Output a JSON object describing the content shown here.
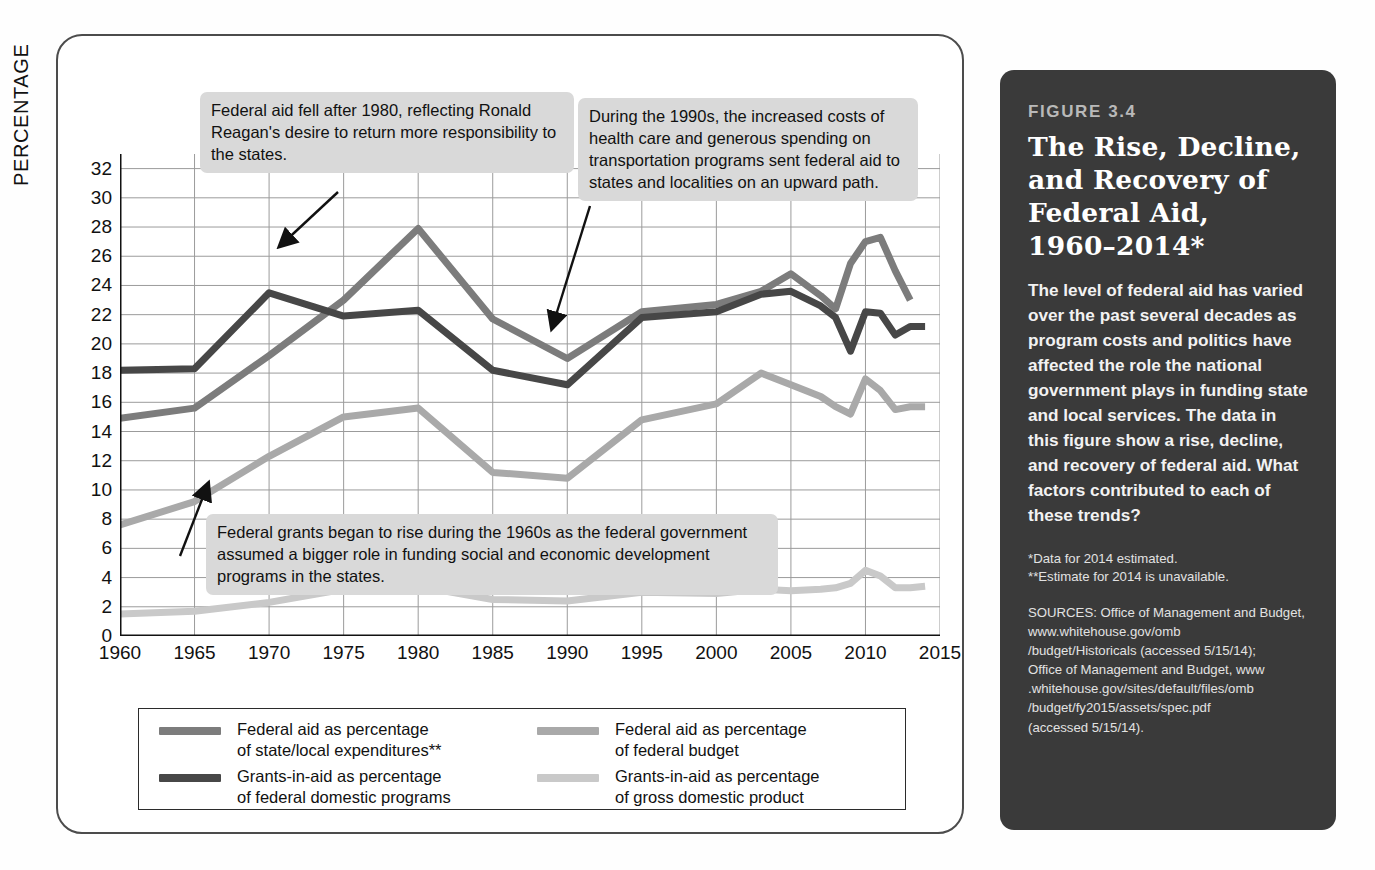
{
  "axis": {
    "ylabel": "PERCENTAGE",
    "yticks": [
      0,
      2,
      4,
      6,
      8,
      10,
      12,
      14,
      16,
      18,
      20,
      22,
      24,
      26,
      28,
      30,
      32
    ],
    "xticks": [
      "1960",
      "1965",
      "1970",
      "1975",
      "1980",
      "1985",
      "1990",
      "1995",
      "2000",
      "2005",
      "2010",
      "2015"
    ]
  },
  "callouts": [
    {
      "id": "callout-1",
      "text": "Federal aid fell after 1980, reflecting Ronald Reagan's desire to return more responsibility to the states."
    },
    {
      "id": "callout-2",
      "text": "During the 1990s, the increased costs of health care and generous spending on transportation programs sent federal aid to states and localities on an upward path."
    },
    {
      "id": "callout-3",
      "text": "Federal grants began to rise during the 1960s as the federal government assumed a bigger role in funding social and economic development programs in the states."
    }
  ],
  "legend": {
    "items": [
      {
        "label": "Federal aid as percentage\nof state/local expenditures**",
        "color": "#7c7c7c"
      },
      {
        "label": "Grants-in-aid as percentage\nof federal domestic programs",
        "color": "#474747"
      },
      {
        "label": "Federal aid as percentage\nof federal budget",
        "color": "#a9a9a9"
      },
      {
        "label": "Grants-in-aid as percentage\nof gross domestic product",
        "color": "#c9c9c9"
      }
    ]
  },
  "caption": {
    "figure_label": "FIGURE 3.4",
    "title": "The Rise, Decline,\nand Recovery of\nFederal Aid,\n1960–2014*",
    "body": "The level of federal aid has varied over the past several decades as program costs and politics have affected the role the national government plays in funding state and local services. The data in this figure show a rise, decline, and recovery of federal aid. What factors contributed to each of these trends?",
    "footnote_1": "*Data for 2014 estimated.",
    "footnote_2": "**Estimate for 2014 is unavailable.",
    "sources": "SOURCES: Office of Management and Budget, www.whitehouse.gov/omb\n/budget/Historicals (accessed 5/15/14);\nOffice of Management and Budget, www\n.whitehouse.gov/sites/default/files/omb\n/budget/fy2015/assets/spec.pdf\n(accessed 5/15/14)."
  },
  "colors": {
    "panel_border": "#4c4c4c",
    "caption_bg": "#3a3a3a",
    "callout_bg": "#d9d9d9",
    "grid": "#9b9b9b",
    "axis": "#111111"
  },
  "chart_data": {
    "type": "line",
    "xlabel": "",
    "ylabel": "PERCENTAGE",
    "xlim": [
      1960,
      2015
    ],
    "ylim": [
      0,
      33
    ],
    "grid": true,
    "legend_position": "bottom",
    "series": [
      {
        "name": "Federal aid as percentage of state/local expenditures**",
        "color": "#7c7c7c",
        "x": [
          1960,
          1965,
          1970,
          1975,
          1980,
          1985,
          1990,
          1995,
          2000,
          2003,
          2005,
          2007,
          2008,
          2009,
          2010,
          2011,
          2012,
          2013
        ],
        "values": [
          14.9,
          15.6,
          19.2,
          23.0,
          27.9,
          21.7,
          19.0,
          22.2,
          22.7,
          23.6,
          24.8,
          23.3,
          22.4,
          25.5,
          27.0,
          27.3,
          25.0,
          23.0
        ]
      },
      {
        "name": "Grants-in-aid as percentage of federal domestic programs",
        "color": "#474747",
        "x": [
          1960,
          1965,
          1970,
          1975,
          1980,
          1985,
          1990,
          1995,
          2000,
          2003,
          2005,
          2007,
          2008,
          2009,
          2010,
          2011,
          2012,
          2013,
          2014
        ],
        "values": [
          18.2,
          18.3,
          23.5,
          21.9,
          22.3,
          18.2,
          17.2,
          21.8,
          22.2,
          23.4,
          23.6,
          22.6,
          21.8,
          19.5,
          22.2,
          22.1,
          20.6,
          21.2,
          21.2
        ]
      },
      {
        "name": "Federal aid as percentage of federal budget",
        "color": "#a9a9a9",
        "x": [
          1960,
          1965,
          1970,
          1975,
          1980,
          1985,
          1990,
          1995,
          2000,
          2003,
          2005,
          2007,
          2008,
          2009,
          2010,
          2011,
          2012,
          2013,
          2014
        ],
        "values": [
          7.6,
          9.2,
          12.3,
          15.0,
          15.6,
          11.2,
          10.8,
          14.8,
          15.9,
          18.0,
          17.2,
          16.4,
          15.7,
          15.2,
          17.6,
          16.8,
          15.5,
          15.7,
          15.7
        ]
      },
      {
        "name": "Grants-in-aid as percentage of gross domestic product",
        "color": "#c9c9c9",
        "x": [
          1960,
          1965,
          1970,
          1975,
          1980,
          1985,
          1990,
          1995,
          2000,
          2003,
          2005,
          2007,
          2008,
          2009,
          2010,
          2011,
          2012,
          2013,
          2014
        ],
        "values": [
          1.5,
          1.7,
          2.3,
          3.2,
          3.4,
          2.5,
          2.4,
          3.0,
          2.9,
          3.2,
          3.1,
          3.2,
          3.3,
          3.6,
          4.5,
          4.1,
          3.3,
          3.3,
          3.4
        ]
      }
    ],
    "annotations": [
      {
        "text": "Federal aid fell after 1980, reflecting Ronald Reagan's desire to return more responsibility to the states.",
        "points_to": {
          "x": 1980,
          "y": 27.9
        }
      },
      {
        "text": "During the 1990s, the increased costs of health care and generous spending on transportation programs sent federal aid to states and localities on an upward path.",
        "points_to": {
          "x": 1993,
          "y": 21.5
        }
      },
      {
        "text": "Federal grants began to rise during the 1960s as the federal government assumed a bigger role in funding social and economic development programs in the states.",
        "points_to": {
          "x": 1965,
          "y": 15.6
        }
      }
    ]
  }
}
